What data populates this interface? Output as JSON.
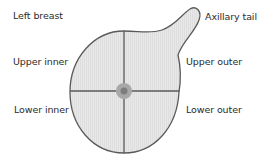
{
  "diagram": {
    "title": "Left breast",
    "labels": {
      "axillary_tail": "Axillary tail",
      "upper_inner": "Upper inner",
      "upper_outer": "Upper outer",
      "lower_inner": "Lower inner",
      "lower_outer": "Lower outer"
    },
    "colors": {
      "outline": "#5a5a5a",
      "fill": "#e6e6e6",
      "nipple_outer": "#a8a8a8",
      "nipple_inner": "#7a7a7a",
      "text": "#2b2b2b"
    }
  }
}
